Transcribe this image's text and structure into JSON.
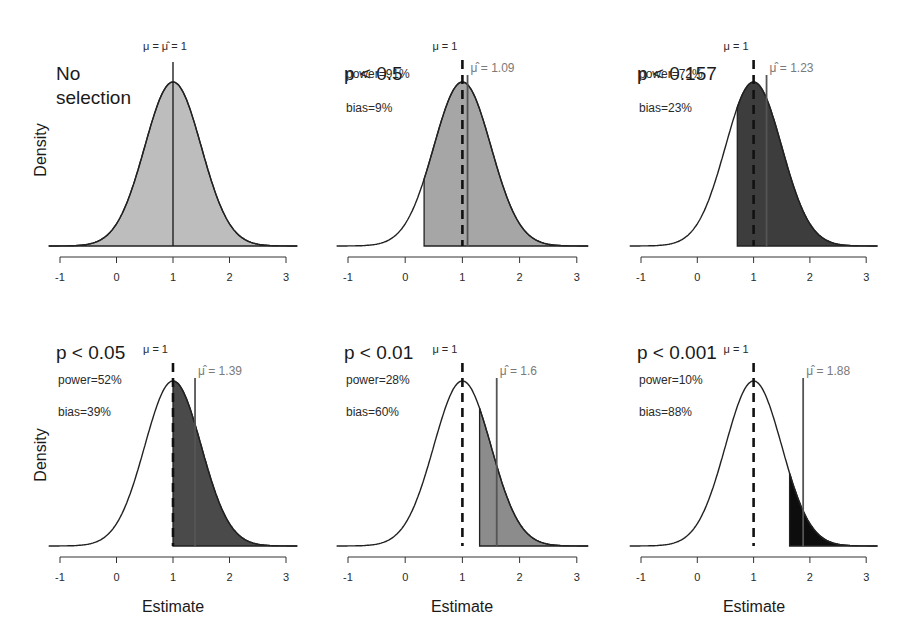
{
  "chart_data": {
    "type": "area",
    "title": "",
    "xlabel": "Estimate",
    "ylabel": "Density",
    "xlim": [
      -1,
      3.2
    ],
    "xticks": [
      -1,
      0,
      1,
      2,
      3
    ],
    "xtick_labels": [
      "-1",
      "0",
      "1",
      "2",
      "3"
    ],
    "grid": false,
    "distribution": {
      "family": "normal",
      "mean": 1,
      "sd": 0.5
    },
    "true_mu": 1,
    "panels": [
      {
        "title_lines": [
          "No",
          "selection"
        ],
        "selection": "none",
        "mu_label": "μ = μ̂ = 1",
        "muhat": 1.0,
        "muhat_label": "",
        "power_label": "",
        "bias_label": "",
        "shade_from": -1.2,
        "fill_color": "#bdbdbd",
        "mu_dashed": false
      },
      {
        "title_lines": [
          "p < 0.5"
        ],
        "selection": "p < 0.5",
        "mu_label": "μ = 1",
        "muhat": 1.09,
        "muhat_label": "μ̂ = 1.09",
        "power": 91,
        "bias": 9,
        "power_label": "power=91%",
        "bias_label": "bias=9%",
        "shade_from": 0.33,
        "fill_color": "#a6a6a6",
        "mu_dashed": true
      },
      {
        "title_lines": [
          "p < 0.157"
        ],
        "selection": "p < 0.157",
        "mu_label": "μ = 1",
        "muhat": 1.23,
        "muhat_label": "μ̂ = 1.23",
        "power": 72,
        "bias": 23,
        "power_label": "power=72%",
        "bias_label": "bias=23%",
        "shade_from": 0.71,
        "fill_color": "#3d3d3d",
        "mu_dashed": true
      },
      {
        "title_lines": [
          "p < 0.05"
        ],
        "selection": "p < 0.05",
        "mu_label": "μ = 1",
        "muhat": 1.39,
        "muhat_label": "μ̂ = 1.39",
        "power": 52,
        "bias": 39,
        "power_label": "power=52%",
        "bias_label": "bias=39%",
        "shade_from": 1.0,
        "fill_color": "#4a4a4a",
        "mu_dashed": true
      },
      {
        "title_lines": [
          "p < 0.01"
        ],
        "selection": "p < 0.01",
        "mu_label": "μ = 1",
        "muhat": 1.6,
        "muhat_label": "μ̂ = 1.6",
        "power": 28,
        "bias": 60,
        "power_label": "power=28%",
        "bias_label": "bias=60%",
        "shade_from": 1.3,
        "fill_color": "#8c8c8c",
        "mu_dashed": true
      },
      {
        "title_lines": [
          "p < 0.001"
        ],
        "selection": "p < 0.001",
        "mu_label": "μ = 1",
        "muhat": 1.88,
        "muhat_label": "μ̂ = 1.88",
        "power": 10,
        "bias": 88,
        "power_label": "power=10%",
        "bias_label": "bias=88%",
        "shade_from": 1.64,
        "fill_color": "#0d0d0d",
        "mu_dashed": true
      }
    ]
  },
  "labels": {
    "ylabel_top": "Density",
    "ylabel_bottom": "Density",
    "xlabel_col1": "Estimate",
    "xlabel_col2": "Estimate",
    "xlabel_col3": "Estimate"
  }
}
